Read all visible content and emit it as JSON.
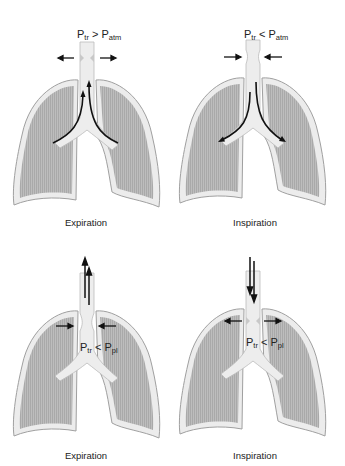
{
  "figure": {
    "panels": [
      {
        "id": "top-left",
        "caption": "Expiration",
        "pressure_label": {
          "lhs": "P",
          "lhs_sub": "tr",
          "op": ">",
          "rhs": "P",
          "rhs_sub": "atm"
        },
        "airflow": "outward (up the trachea from both bronchi)",
        "trachea_wall_arrows": "outward (dilation)"
      },
      {
        "id": "top-right",
        "caption": "Inspiration",
        "pressure_label": {
          "lhs": "P",
          "lhs_sub": "tr",
          "op": "<",
          "rhs": "P",
          "rhs_sub": "atm"
        },
        "airflow": "inward (down the trachea into both bronchi)",
        "trachea_wall_arrows": "inward (compression)"
      },
      {
        "id": "bottom-left",
        "caption": "Expiration",
        "pressure_label": {
          "lhs": "P",
          "lhs_sub": "tr",
          "op": "<",
          "rhs": "P",
          "rhs_sub": "pl"
        },
        "airflow": "outward (up and out of the trachea)",
        "trachea_wall_arrows": "inward (compression)"
      },
      {
        "id": "bottom-right",
        "caption": "Inspiration",
        "pressure_label": {
          "lhs": "P",
          "lhs_sub": "tr",
          "op": "<",
          "rhs": "P",
          "rhs_sub": "pl"
        },
        "airflow": "inward (down into the trachea)",
        "trachea_wall_arrows": "outward (dilation)"
      }
    ],
    "colors": {
      "lung_fill": "#b8b8b8",
      "pleura": "#ececec",
      "outline": "#9a9a9a",
      "arrow": "#111111"
    }
  }
}
